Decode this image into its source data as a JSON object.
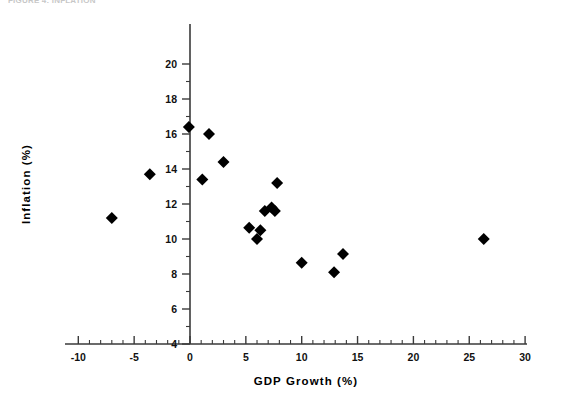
{
  "figure": {
    "caption": "FIGURE 4: INFLATION",
    "caption_visible": true
  },
  "chart_data": {
    "type": "scatter",
    "title": "",
    "xlabel": "GDP  Growth  (%)",
    "ylabel": "Inflation  (%)",
    "xlim": [
      -10,
      30
    ],
    "ylim": [
      4,
      20
    ],
    "xticks": [
      -10,
      -5,
      0,
      5,
      10,
      15,
      20,
      25,
      30
    ],
    "xtick_labels": [
      "-10",
      "-5",
      "0",
      "5",
      "10",
      "15",
      "20",
      "25",
      "30"
    ],
    "yticks": [
      4,
      6,
      8,
      10,
      12,
      14,
      16,
      18,
      20
    ],
    "ytick_labels": [
      "4",
      "6",
      "8",
      "10",
      "12",
      "14",
      "16",
      "18",
      "20"
    ],
    "x_minor_step": 1,
    "y_minor_step": 1,
    "grid": false,
    "legend": false,
    "marker": "diamond",
    "marker_color": "#000000",
    "marker_size": 9,
    "points": [
      {
        "x": -7.0,
        "y": 11.2
      },
      {
        "x": -3.6,
        "y": 13.7
      },
      {
        "x": -0.1,
        "y": 16.4
      },
      {
        "x": 1.1,
        "y": 13.4
      },
      {
        "x": 1.7,
        "y": 16.0
      },
      {
        "x": 3.0,
        "y": 14.4
      },
      {
        "x": 5.3,
        "y": 10.65
      },
      {
        "x": 6.0,
        "y": 10.0
      },
      {
        "x": 6.3,
        "y": 10.5
      },
      {
        "x": 6.7,
        "y": 11.6
      },
      {
        "x": 7.3,
        "y": 11.8
      },
      {
        "x": 7.6,
        "y": 11.6
      },
      {
        "x": 7.8,
        "y": 13.2
      },
      {
        "x": 10.0,
        "y": 8.65
      },
      {
        "x": 12.9,
        "y": 8.1
      },
      {
        "x": 13.7,
        "y": 9.15
      },
      {
        "x": 26.3,
        "y": 10.0
      }
    ]
  },
  "axis_geometry": {
    "plot_left_px": 190,
    "plot_bottom_px": 344,
    "x_px_per_unit": 11.17,
    "y_px_per_unit": 17.5,
    "x_axis_start_px": 65,
    "x_axis_end_px": 527,
    "y_axis_top_px": 24
  }
}
